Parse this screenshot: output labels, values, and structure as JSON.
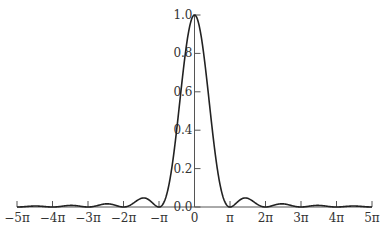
{
  "chart_data": {
    "type": "line",
    "title": "",
    "xlabel": "",
    "ylabel": "",
    "function": "(sin(x)/x)^2",
    "xlim_in_pi": [
      -5,
      5
    ],
    "ylim": [
      0.0,
      1.0
    ],
    "grid": false,
    "legend": null,
    "x_ticks": [
      {
        "value_in_pi": -5,
        "label": "−5π"
      },
      {
        "value_in_pi": -4,
        "label": "−4π"
      },
      {
        "value_in_pi": -3,
        "label": "−3π"
      },
      {
        "value_in_pi": -2,
        "label": "−2π"
      },
      {
        "value_in_pi": -1,
        "label": "−π"
      },
      {
        "value_in_pi": 0,
        "label": "0"
      },
      {
        "value_in_pi": 1,
        "label": "π"
      },
      {
        "value_in_pi": 2,
        "label": "2π"
      },
      {
        "value_in_pi": 3,
        "label": "3π"
      },
      {
        "value_in_pi": 4,
        "label": "4π"
      },
      {
        "value_in_pi": 5,
        "label": "5π"
      }
    ],
    "y_ticks": [
      {
        "value": 0.0,
        "label": "0.0"
      },
      {
        "value": 0.2,
        "label": "0.2"
      },
      {
        "value": 0.4,
        "label": "0.4"
      },
      {
        "value": 0.6,
        "label": "0.6"
      },
      {
        "value": 0.8,
        "label": "0.8"
      },
      {
        "value": 1.0,
        "label": "1.0"
      }
    ],
    "series": [
      {
        "name": "sinc squared",
        "key_points": [
          {
            "x_in_pi": -5,
            "y": 0.0
          },
          {
            "x_in_pi": -4.47,
            "y": 0.0051
          },
          {
            "x_in_pi": -4,
            "y": 0.0
          },
          {
            "x_in_pi": -3.47,
            "y": 0.0083
          },
          {
            "x_in_pi": -3,
            "y": 0.0
          },
          {
            "x_in_pi": -2.46,
            "y": 0.0165
          },
          {
            "x_in_pi": -2,
            "y": 0.0
          },
          {
            "x_in_pi": -1.43,
            "y": 0.0472
          },
          {
            "x_in_pi": -1,
            "y": 0.0
          },
          {
            "x_in_pi": 0,
            "y": 1.0
          },
          {
            "x_in_pi": 1,
            "y": 0.0
          },
          {
            "x_in_pi": 1.43,
            "y": 0.0472
          },
          {
            "x_in_pi": 2,
            "y": 0.0
          },
          {
            "x_in_pi": 2.46,
            "y": 0.0165
          },
          {
            "x_in_pi": 3,
            "y": 0.0
          },
          {
            "x_in_pi": 3.47,
            "y": 0.0083
          },
          {
            "x_in_pi": 4,
            "y": 0.0
          },
          {
            "x_in_pi": 4.47,
            "y": 0.0051
          },
          {
            "x_in_pi": 5,
            "y": 0.0
          }
        ]
      }
    ]
  }
}
